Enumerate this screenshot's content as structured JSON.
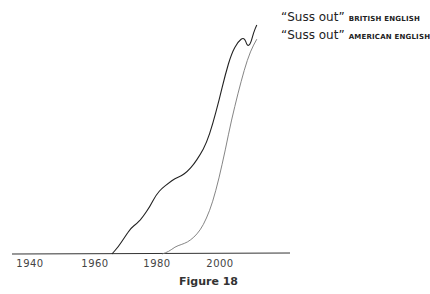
{
  "chart_data": {
    "type": "line",
    "title": "",
    "caption": "Figure 18",
    "xlabel": "",
    "ylabel": "",
    "x_ticks": [
      "1940",
      "1960",
      "1980",
      "2000"
    ],
    "xlim": [
      1936,
      2022
    ],
    "ylim": [
      0,
      100
    ],
    "grid": false,
    "legend_position": "inline-end-of-lines (top right)",
    "series": [
      {
        "name": "“Suss out” BRITISH ENGLISH",
        "color": "#222222",
        "x": [
          1966,
          1968,
          1970,
          1972,
          1974,
          1976,
          1978,
          1980,
          1982,
          1984,
          1986,
          1988,
          1990,
          1992,
          1994,
          1996,
          1998,
          2000,
          2002,
          2004,
          2006,
          2008,
          2009,
          2010,
          2011,
          2012
        ],
        "values": [
          0,
          3,
          7,
          11,
          13,
          16,
          20,
          25,
          28,
          30,
          32,
          33,
          35,
          38,
          42,
          47,
          55,
          65,
          76,
          85,
          90,
          92,
          88,
          89,
          94,
          97
        ]
      },
      {
        "name": "“Suss out” AMERICAN ENGLISH",
        "color": "#777777",
        "x": [
          1982,
          1984,
          1986,
          1988,
          1990,
          1992,
          1994,
          1996,
          1998,
          2000,
          2002,
          2004,
          2006,
          2008,
          2010,
          2012
        ],
        "values": [
          0,
          1,
          3,
          4,
          5,
          7,
          10,
          15,
          22,
          32,
          44,
          57,
          68,
          78,
          86,
          91
        ]
      }
    ]
  },
  "legend": {
    "british": {
      "quote": "“Suss out”",
      "label": "BRITISH ENGLISH"
    },
    "american": {
      "quote": "“Suss out”",
      "label": "AMERICAN ENGLISH"
    }
  },
  "axis": {
    "ticks": [
      {
        "label": "1940",
        "x": 30
      },
      {
        "label": "1960",
        "x": 95
      },
      {
        "label": "1980",
        "x": 157
      },
      {
        "label": "2000",
        "x": 220
      }
    ]
  },
  "caption": "Figure 18"
}
